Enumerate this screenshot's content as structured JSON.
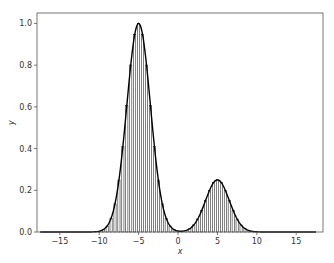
{
  "chart_data": {
    "type": "bar",
    "title": "",
    "xlabel": "x",
    "ylabel": "y",
    "xlim": [
      -17.9,
      18.4
    ],
    "ylim": [
      0.0,
      1.05
    ],
    "grid": false,
    "legend": null,
    "x_ticks": [
      -15,
      -10,
      -5,
      0,
      5,
      10,
      15
    ],
    "x_tick_labels": [
      "−15",
      "−10",
      "−5",
      "0",
      "5",
      "10",
      "15"
    ],
    "y_ticks": [
      0.0,
      0.2,
      0.4,
      0.6,
      0.8,
      1.0
    ],
    "y_tick_labels": [
      "0.0",
      "0.2",
      "0.4",
      "0.6",
      "0.8",
      "1.0"
    ],
    "series": [
      {
        "name": "bars",
        "kind": "bar",
        "color": "#000000",
        "fill": "#ffffff",
        "description": "Narrow outlined bars sampling the curve every 0.5 units from -17.5 to 17.5",
        "components": [
          {
            "center": -5,
            "amplitude": 1.0,
            "sigma": 1.5
          },
          {
            "center": 5,
            "amplitude": 0.25,
            "sigma": 1.5
          }
        ],
        "step": 0.5,
        "x_start": -17.5,
        "x_end": 17.5
      },
      {
        "name": "curve",
        "kind": "line",
        "color": "#000000",
        "components": [
          {
            "center": -5,
            "amplitude": 1.0,
            "sigma": 1.5
          },
          {
            "center": 5,
            "amplitude": 0.25,
            "sigma": 1.5
          }
        ]
      }
    ],
    "key_points": [
      {
        "x": -5,
        "y": 1.0
      },
      {
        "x": 0,
        "y": 0.0
      },
      {
        "x": 5,
        "y": 0.25
      },
      {
        "x": -10,
        "y": 0.0
      },
      {
        "x": 10,
        "y": 0.0
      }
    ]
  },
  "colors": {
    "background": "#ffffff",
    "frame": "#555555",
    "ink": "#000000",
    "text": "#333333"
  }
}
